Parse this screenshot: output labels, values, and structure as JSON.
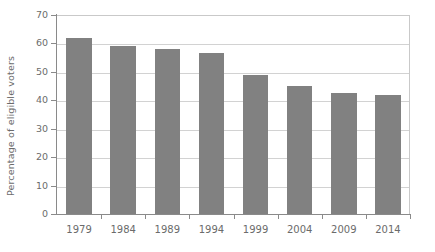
{
  "chart_data": {
    "type": "bar",
    "title": "",
    "xlabel": "",
    "ylabel": "Percentage of eligible voters",
    "categories": [
      "1979",
      "1984",
      "1989",
      "1994",
      "1999",
      "2004",
      "2009",
      "2014"
    ],
    "values": [
      62,
      59,
      58,
      56.5,
      49,
      45,
      42.5,
      42
    ],
    "ylim": [
      0,
      70
    ],
    "ytick_labels": [
      "0",
      "10",
      "20",
      "30",
      "40",
      "50",
      "60",
      "70"
    ],
    "ytick_values": [
      0,
      10,
      20,
      30,
      40,
      50,
      60,
      70
    ],
    "grid": true,
    "legend": "none",
    "series_name": "Voter turnout",
    "bar_color": "#818181",
    "grid_color": "#d2d2d2",
    "axis_color": "#8a8a8a",
    "text_color": "#6b6b6b",
    "background": "#ffffff"
  }
}
